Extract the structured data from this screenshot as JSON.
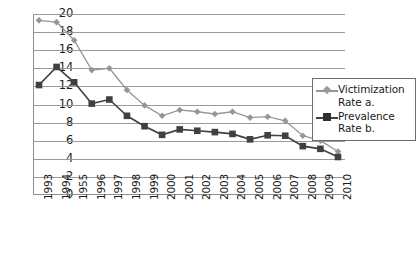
{
  "chart_data": {
    "type": "line",
    "title": "",
    "xlabel": "",
    "ylabel": "",
    "ylim": [
      0,
      20
    ],
    "ytick_step": 2,
    "yticks": [
      20,
      18,
      16,
      14,
      12,
      10,
      8,
      6,
      4,
      2,
      0
    ],
    "grid": "horizontal",
    "legend_position": "right-inside",
    "categories": [
      "1993",
      "1994",
      "1955",
      "1996",
      "1997",
      "1998",
      "1999",
      "2000",
      "2001",
      "2002",
      "2003",
      "2004",
      "2005",
      "2006",
      "2007",
      "2008",
      "2009",
      "2010"
    ],
    "series": [
      {
        "name": "Victimization Rate a.",
        "color": "#969696",
        "marker": "diamond",
        "values": [
          19.3,
          19.1,
          17.1,
          13.8,
          14.0,
          11.6,
          9.9,
          8.75,
          9.4,
          9.2,
          8.95,
          9.2,
          8.55,
          8.65,
          8.2,
          6.55,
          6.0,
          4.8
        ]
      },
      {
        "name": "Prevalence Rate b.",
        "color": "#404040",
        "marker": "square",
        "values": [
          12.15,
          14.15,
          12.45,
          10.1,
          10.55,
          8.75,
          7.6,
          6.65,
          7.25,
          7.1,
          6.95,
          6.75,
          6.15,
          6.6,
          6.55,
          5.4,
          5.1,
          4.2
        ]
      }
    ]
  },
  "legend": {
    "items": [
      {
        "label": "Victimization Rate a.",
        "marker": "diamond-marker-icon"
      },
      {
        "label": "Prevalence Rate b.",
        "marker": "square-marker-icon"
      }
    ]
  },
  "colors": {
    "victimization": "#969696",
    "prevalence": "#404040",
    "gridline": "#9a9a9a",
    "axis": "#8f8f8f",
    "text": "#1a1a1a",
    "background": "#ffffff"
  }
}
